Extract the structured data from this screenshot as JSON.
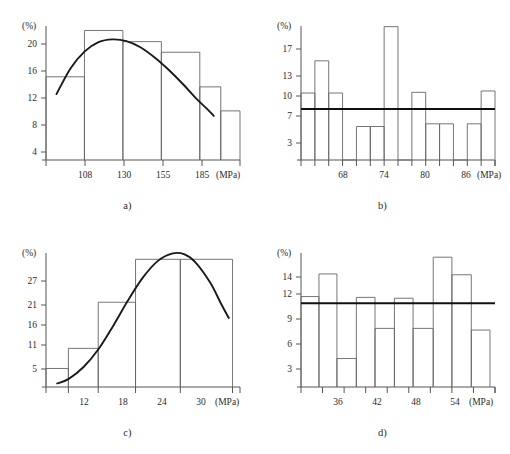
{
  "figure": {
    "panels": [
      {
        "id": "a",
        "caption": "a)"
      },
      {
        "id": "b",
        "caption": "b)"
      },
      {
        "id": "c",
        "caption": "c)"
      },
      {
        "id": "d",
        "caption": "d)"
      }
    ],
    "y_unit": "(%)",
    "x_unit": "(MPa)"
  },
  "chart_data": [
    {
      "id": "a",
      "type": "bar",
      "title": "a)",
      "xlabel": "(MPa)",
      "ylabel": "(%)",
      "grid": false,
      "legend": "none",
      "ylim": [
        0,
        24
      ],
      "xlim": [
        96,
        207
      ],
      "yticks": [
        4,
        8,
        12,
        16,
        20
      ],
      "xticks": [
        108,
        130,
        155,
        185
      ],
      "bin_edges": [
        96,
        118,
        140,
        162,
        184,
        206
      ],
      "values": [
        14.9,
        23.2,
        21.2,
        19.3,
        13.1,
        8.8
      ],
      "bars": [
        {
          "x0": 96,
          "x1": 118,
          "height": 14.9
        },
        {
          "x0": 118,
          "x1": 140,
          "height": 23.2
        },
        {
          "x0": 140,
          "x1": 162,
          "height": 21.2
        },
        {
          "x0": 162,
          "x1": 184,
          "height": 19.3
        },
        {
          "x0": 184,
          "x1": 196,
          "height": 13.1
        },
        {
          "x0": 196,
          "x1": 207,
          "height": 8.8
        }
      ],
      "curve": {
        "name": "normal-fit-curve",
        "points": [
          [
            102,
            11.8
          ],
          [
            110,
            16.4
          ],
          [
            118,
            19.4
          ],
          [
            126,
            21.1
          ],
          [
            134,
            21.6
          ],
          [
            142,
            21.3
          ],
          [
            150,
            20.2
          ],
          [
            158,
            18.4
          ],
          [
            166,
            16.2
          ],
          [
            174,
            13.7
          ],
          [
            182,
            11.0
          ],
          [
            188,
            9.2
          ],
          [
            192,
            7.9
          ]
        ]
      }
    },
    {
      "id": "b",
      "type": "bar",
      "title": "b)",
      "xlabel": "(MPa)",
      "ylabel": "(%)",
      "grid": false,
      "legend": "none",
      "ylim": [
        0,
        20
      ],
      "xlim": [
        62,
        90
      ],
      "yticks": [
        3,
        7,
        10,
        13,
        17
      ],
      "xticks": [
        68,
        74,
        80,
        86
      ],
      "bin_edges": [
        62,
        64,
        66,
        68,
        70,
        72,
        74,
        76,
        78,
        80,
        82,
        84,
        86,
        88,
        90
      ],
      "values": [
        10.0,
        14.8,
        10.0,
        0,
        5.0,
        5.0,
        19.9,
        0,
        10.1,
        5.4,
        5.4,
        0,
        5.4,
        10.3
      ],
      "bars": [
        {
          "x0": 62,
          "x1": 64,
          "height": 10.0
        },
        {
          "x0": 64,
          "x1": 66,
          "height": 14.8
        },
        {
          "x0": 66,
          "x1": 68,
          "height": 10.0
        },
        {
          "x0": 68,
          "x1": 70,
          "height": 0
        },
        {
          "x0": 70,
          "x1": 72,
          "height": 5.0
        },
        {
          "x0": 72,
          "x1": 74,
          "height": 5.0
        },
        {
          "x0": 74,
          "x1": 76,
          "height": 19.9
        },
        {
          "x0": 76,
          "x1": 78,
          "height": 0
        },
        {
          "x0": 78,
          "x1": 80,
          "height": 10.1
        },
        {
          "x0": 80,
          "x1": 82,
          "height": 5.4
        },
        {
          "x0": 82,
          "x1": 84,
          "height": 5.4
        },
        {
          "x0": 84,
          "x1": 86,
          "height": 0
        },
        {
          "x0": 86,
          "x1": 88,
          "height": 5.4
        },
        {
          "x0": 88,
          "x1": 90,
          "height": 10.3
        }
      ],
      "mean_line": {
        "name": "mean-reference-line",
        "value": 7.6
      }
    },
    {
      "id": "c",
      "type": "bar",
      "title": "c)",
      "xlabel": "(MPa)",
      "ylabel": "(%)",
      "grid": false,
      "legend": "none",
      "ylim": [
        0,
        34
      ],
      "xlim": [
        8,
        34
      ],
      "yticks": [
        5,
        11,
        16,
        21,
        27
      ],
      "xticks": [
        12,
        18,
        24,
        30
      ],
      "bin_edges": [
        8,
        11,
        15,
        20,
        26,
        33
      ],
      "values": [
        4.7,
        9.8,
        21.5,
        32.4,
        32.4
      ],
      "bars": [
        {
          "x0": 8,
          "x1": 11,
          "height": 4.7
        },
        {
          "x0": 11,
          "x1": 15,
          "height": 9.8
        },
        {
          "x0": 15,
          "x1": 20,
          "height": 21.5
        },
        {
          "x0": 20,
          "x1": 26,
          "height": 32.4
        },
        {
          "x0": 26,
          "x1": 33,
          "height": 32.4
        }
      ],
      "curve": {
        "name": "normal-fit-curve",
        "points": [
          [
            9.5,
            0.9
          ],
          [
            11,
            2.0
          ],
          [
            13,
            5.0
          ],
          [
            15,
            9.5
          ],
          [
            17,
            15.5
          ],
          [
            19,
            22.0
          ],
          [
            21,
            27.8
          ],
          [
            23,
            32.0
          ],
          [
            25,
            33.9
          ],
          [
            26.5,
            33.7
          ],
          [
            28,
            31.7
          ],
          [
            30,
            26.5
          ],
          [
            31.5,
            21.0
          ],
          [
            32.5,
            17.5
          ]
        ]
      }
    },
    {
      "id": "d",
      "type": "bar",
      "title": "d)",
      "xlabel": "(MPa)",
      "ylabel": "(%)",
      "grid": false,
      "legend": "none",
      "ylim": [
        0,
        16
      ],
      "xlim": [
        31,
        58
      ],
      "yticks": [
        3,
        6,
        9,
        12,
        14
      ],
      "xticks": [
        36,
        42,
        48,
        54
      ],
      "bin_edges": [
        31,
        34,
        37,
        40,
        43,
        46,
        49,
        52,
        55,
        58
      ],
      "values": [
        10.8,
        13.5,
        3.4,
        10.7,
        7.0,
        10.6,
        7.0,
        15.5,
        13.4,
        6.8
      ],
      "bars": [
        {
          "x0": 31,
          "x1": 33.5,
          "height": 10.8
        },
        {
          "x0": 33.5,
          "x1": 36,
          "height": 13.5
        },
        {
          "x0": 36,
          "x1": 38.7,
          "height": 3.4
        },
        {
          "x0": 38.7,
          "x1": 41.3,
          "height": 10.7
        },
        {
          "x0": 41.3,
          "x1": 44,
          "height": 7.0
        },
        {
          "x0": 44,
          "x1": 46.6,
          "height": 10.6
        },
        {
          "x0": 46.6,
          "x1": 49.4,
          "height": 7.0
        },
        {
          "x0": 49.4,
          "x1": 52,
          "height": 15.5
        },
        {
          "x0": 52,
          "x1": 54.7,
          "height": 13.4
        },
        {
          "x0": 54.7,
          "x1": 57.3,
          "height": 6.8
        }
      ],
      "mean_line": {
        "name": "mean-reference-line",
        "value": 10.0
      }
    }
  ]
}
